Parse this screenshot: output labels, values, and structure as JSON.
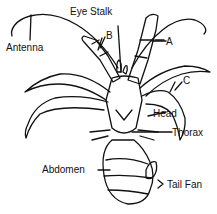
{
  "diagram": {
    "labels": {
      "eye_stalk": "Eye Stalk",
      "antenna": "Antenna",
      "a": "A",
      "b": "B",
      "c": "C",
      "head": "Head",
      "thorax": "Thorax",
      "abdomen": "Abdomen",
      "tail_fan": "Tail Fan"
    },
    "colors": {
      "ink": "#111111",
      "background": "#ffffff"
    }
  }
}
